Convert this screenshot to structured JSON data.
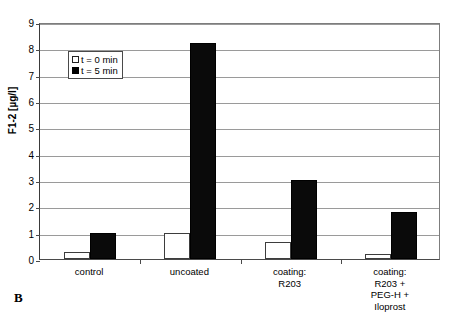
{
  "panel": {
    "letter": "B"
  },
  "chart_data": {
    "type": "bar",
    "title": "",
    "subtitle": "",
    "xlabel": "",
    "ylabel": "F1-2 [µg/l]",
    "ylim": [
      0,
      9
    ],
    "ytick_step": 1,
    "yticks": [
      "0",
      "1",
      "2",
      "3",
      "4",
      "5",
      "6",
      "7",
      "8",
      "9"
    ],
    "grid": true,
    "legend_position": "upper-left-inside",
    "categories": [
      "control",
      "uncoated",
      "coating:\nR203",
      "coating:\nR203 +\nPEG-H +\nIloprost"
    ],
    "series": [
      {
        "name": "t = 0 min",
        "color": "#ffffff",
        "edge_color": "#000000",
        "values": [
          0.27,
          1.0,
          0.65,
          0.2
        ]
      },
      {
        "name": "t = 5 min",
        "color": "#000000",
        "edge_color": "#000000",
        "values": [
          1.0,
          8.2,
          3.0,
          1.8
        ]
      }
    ]
  }
}
